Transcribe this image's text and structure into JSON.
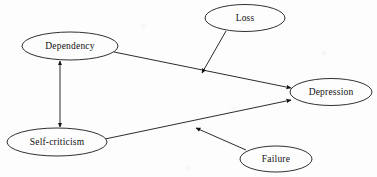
{
  "diagram": {
    "type": "path-diagram",
    "background_color": "#fdfdfd",
    "line_color": "#141414",
    "text_color": "#111111",
    "nodes": [
      {
        "id": "dependency",
        "label": "Dependency",
        "shape": "ellipse",
        "cx": 70,
        "cy": 46,
        "rx": 48,
        "ry": 14
      },
      {
        "id": "loss",
        "label": "Loss",
        "shape": "ellipse",
        "cx": 245,
        "cy": 18,
        "rx": 40,
        "ry": 13.5
      },
      {
        "id": "self_criticism",
        "label": "Self-criticism",
        "shape": "ellipse",
        "cx": 57,
        "cy": 142,
        "rx": 50,
        "ry": 14
      },
      {
        "id": "failure",
        "label": "Failure",
        "shape": "ellipse",
        "cx": 276,
        "cy": 159,
        "rx": 36,
        "ry": 13
      },
      {
        "id": "depression",
        "label": "Depression",
        "shape": "ellipse",
        "cx": 331,
        "cy": 92,
        "rx": 41,
        "ry": 13.5
      }
    ],
    "edges": [
      {
        "id": "dependency-to-depression",
        "from": "dependency",
        "to": "depression",
        "arrow": "single",
        "x1": 114,
        "y1": 52,
        "x2": 291,
        "y2": 88
      },
      {
        "id": "self-criticism-to-depression",
        "from": "self_criticism",
        "to": "depression",
        "arrow": "single",
        "x1": 105,
        "y1": 139,
        "x2": 291,
        "y2": 100
      },
      {
        "id": "dependency-self-criticism-correlation",
        "from": "dependency",
        "to": "self_criticism",
        "arrow": "double",
        "x1": 60,
        "y1": 60,
        "x2": 60,
        "y2": 128
      },
      {
        "id": "loss-to-dependency-depression-path",
        "from": "loss",
        "to": "dependency-to-depression",
        "arrow": "single",
        "x1": 226,
        "y1": 30,
        "x2": 201,
        "y2": 74
      },
      {
        "id": "failure-to-self-criticism-depression-path",
        "from": "failure",
        "to": "self-criticism-to-depression",
        "arrow": "single",
        "x1": 246,
        "y1": 150,
        "x2": 195,
        "y2": 127
      }
    ]
  }
}
